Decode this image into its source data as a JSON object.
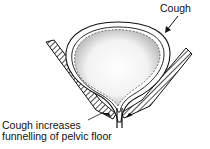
{
  "diagram": {
    "labels": {
      "cough": "Cough",
      "caption_line1": "Cough increases",
      "caption_line2": "funnelling of pelvic floor"
    },
    "colors": {
      "ink": "#111111",
      "background": "#ffffff",
      "stipple": "#9a9a9a"
    }
  }
}
